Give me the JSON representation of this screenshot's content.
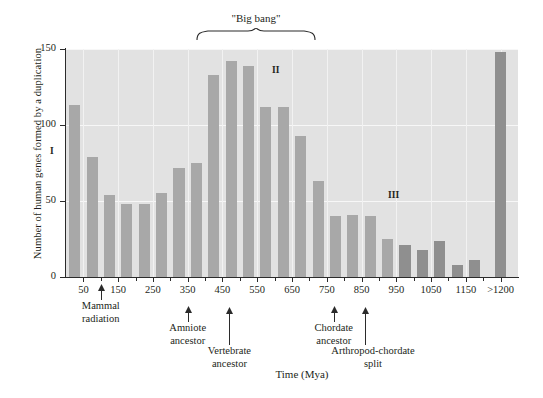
{
  "axes": {
    "ylabel": "Number of human genes formed by a duplication",
    "xlabel": "Time (Mya)",
    "yticks": [
      "0",
      "50",
      "100",
      "150"
    ],
    "ytick_values": [
      0,
      50,
      100,
      150
    ],
    "xticks": [
      "50",
      "150",
      "250",
      "350",
      "450",
      "550",
      "650",
      "750",
      "850",
      "950",
      "1050",
      "1150",
      ">1200"
    ],
    "xtick_values": [
      50,
      150,
      250,
      350,
      450,
      550,
      650,
      750,
      850,
      950,
      1050,
      1150,
      1250
    ]
  },
  "annotations": {
    "bigbang": "\"Big bang\"",
    "romans": [
      {
        "label": "I",
        "x": 50
      },
      {
        "label": "II",
        "x": 272
      },
      {
        "label": "III",
        "x": 388
      }
    ],
    "events": [
      {
        "label": "Mammal\nradiation",
        "line1": "Mammal",
        "line2": "radiation",
        "x": 100
      },
      {
        "label": "Amniote\nancestor",
        "line1": "Amniote",
        "line2": "ancestor",
        "x": 350
      },
      {
        "label": "Vertebrate\nancestor",
        "line1": "Vertebrate",
        "line2": "ancestor",
        "x": 470
      },
      {
        "label": "Chordate\nancestor",
        "line1": "Chordate",
        "line2": "ancestor",
        "x": 770
      },
      {
        "label": "Arthropod-chordate\nsplit",
        "line1": "Arthropod-chordate",
        "line2": "split",
        "x": 860
      }
    ]
  },
  "chart_data": {
    "type": "bar",
    "title": "",
    "xlabel": "Time (Mya)",
    "ylabel": "Number of human genes formed by a duplication",
    "xlim": [
      0,
      1300
    ],
    "ylim": [
      0,
      150
    ],
    "grid": true,
    "legend": "none",
    "bin_width": 50,
    "categories": [
      "25",
      "75",
      "125",
      "175",
      "225",
      "275",
      "325",
      "375",
      "425",
      "475",
      "525",
      "575",
      "625",
      "675",
      "725",
      "775",
      "825",
      "875",
      "925",
      "975",
      "1025",
      "1075",
      "1125",
      "1175",
      ">1200"
    ],
    "bin_centers": [
      25,
      75,
      125,
      175,
      225,
      275,
      325,
      375,
      425,
      475,
      525,
      575,
      625,
      675,
      725,
      775,
      825,
      875,
      925,
      975,
      1025,
      1075,
      1125,
      1175,
      1250
    ],
    "values": [
      113,
      79,
      54,
      48,
      48,
      55,
      72,
      75,
      133,
      142,
      139,
      112,
      112,
      93,
      63,
      40,
      41,
      40,
      25,
      21,
      18,
      24,
      8,
      11,
      148
    ]
  }
}
